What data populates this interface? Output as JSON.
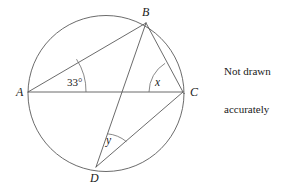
{
  "figure": {
    "type": "circle-geometry-diagram",
    "circle": {
      "cx": 106,
      "cy": 93.5,
      "r": 78
    },
    "vertices": [
      {
        "id": "A",
        "label": "A",
        "x": 28,
        "y": 92,
        "label_x": 16,
        "label_y": 96
      },
      {
        "id": "B",
        "label": "B",
        "x": 146,
        "y": 23,
        "label_x": 142,
        "label_y": 16
      },
      {
        "id": "C",
        "label": "C",
        "x": 183,
        "y": 92,
        "label_x": 190,
        "label_y": 96
      },
      {
        "id": "D",
        "label": "D",
        "x": 96,
        "y": 167,
        "label_x": 90,
        "label_y": 182
      }
    ],
    "chords": [
      {
        "name": "chord-AB",
        "from": "A",
        "to": "B"
      },
      {
        "name": "chord-AC",
        "from": "A",
        "to": "C"
      },
      {
        "name": "chord-BC",
        "from": "B",
        "to": "C"
      },
      {
        "name": "chord-BD",
        "from": "B",
        "to": "D"
      },
      {
        "name": "chord-DC",
        "from": "D",
        "to": "C"
      }
    ],
    "angles": [
      {
        "id": "angle-A",
        "at": "A",
        "label": "33°",
        "value": 33,
        "unit": "degrees",
        "between": [
          "AB",
          "AC"
        ],
        "label_x": 67,
        "label_y": 86,
        "arc_radius": 58
      },
      {
        "id": "angle-C",
        "at": "C",
        "label": "x",
        "value": null,
        "unit": "degrees",
        "between": [
          "CB",
          "CA"
        ],
        "label_x": 155,
        "label_y": 86,
        "arc_radius": 34
      },
      {
        "id": "angle-D",
        "at": "D",
        "label": "y",
        "value": null,
        "unit": "degrees",
        "between": [
          "DB",
          "DC"
        ],
        "label_x": 106,
        "label_y": 144,
        "arc_radius": 35
      }
    ]
  },
  "note": {
    "line1": "Not drawn",
    "line2": "accurately"
  },
  "colors": {
    "stroke": "#5a5a5a",
    "text": "#1a1a1a",
    "background": "#ffffff"
  }
}
